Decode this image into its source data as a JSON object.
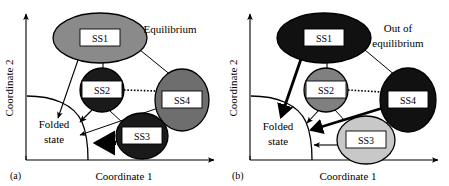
{
  "figure": {
    "panels": [
      {
        "id": "a",
        "panel_label": "(a)",
        "annotation": "Equilibrium",
        "annotation_lines": [
          "Equilibrium"
        ],
        "axes": {
          "xlabel": "Coordinate 1",
          "ylabel": "Coordinate 2"
        },
        "basin_label_lines": [
          "Folded",
          "state"
        ],
        "nodes": [
          {
            "id": "SS1",
            "label": "SS1",
            "cx": 100,
            "cy": 38,
            "rx": 47,
            "ry": 25,
            "fill": "#8a8a8a",
            "shade": "medium-gray"
          },
          {
            "id": "SS2",
            "label": "SS2",
            "cx": 102,
            "cy": 90,
            "rx": 22,
            "ry": 22,
            "fill": "#1a1a1a",
            "shade": "black"
          },
          {
            "id": "SS3",
            "label": "SS3",
            "cx": 142,
            "cy": 136,
            "rx": 26,
            "ry": 23,
            "fill": "#1a1a1a",
            "shade": "black"
          },
          {
            "id": "SS4",
            "label": "SS4",
            "cx": 182,
            "cy": 100,
            "rx": 27,
            "ry": 31,
            "fill": "#6e6e6e",
            "shade": "dark-gray"
          }
        ],
        "edges": [
          {
            "from": "SS1",
            "to": "folded-state",
            "style": "thin-arrow"
          },
          {
            "from": "SS1",
            "to": "SS2",
            "style": "plain-line"
          },
          {
            "from": "SS1",
            "to": "SS4",
            "style": "plain-line"
          },
          {
            "from": "SS2",
            "to": "folded-state",
            "style": "thin-arrow"
          },
          {
            "from": "SS2",
            "to": "SS4",
            "style": "dotted-line"
          },
          {
            "from": "SS2",
            "to": "SS3",
            "style": "plain-line"
          },
          {
            "from": "SS3",
            "to": "folded-state",
            "style": "thick-arrow"
          },
          {
            "from": "SS4",
            "to": "folded-state",
            "style": "thin-arrow"
          },
          {
            "from": "SS4",
            "to": "SS3",
            "style": "plain-line"
          }
        ]
      },
      {
        "id": "b",
        "panel_label": "(b)",
        "annotation": "Out of equilibrium",
        "annotation_lines": [
          "Out of",
          "equilibrium"
        ],
        "axes": {
          "xlabel": "Coordinate 1",
          "ylabel": "Coordinate 2"
        },
        "basin_label_lines": [
          "Folded",
          "state"
        ],
        "nodes": [
          {
            "id": "SS1",
            "label": "SS1",
            "cx": 100,
            "cy": 38,
            "rx": 47,
            "ry": 25,
            "fill": "#111111",
            "shade": "black"
          },
          {
            "id": "SS2",
            "label": "SS2",
            "cx": 102,
            "cy": 90,
            "rx": 22,
            "ry": 22,
            "fill": "#808080",
            "shade": "medium-gray"
          },
          {
            "id": "SS3",
            "label": "SS3",
            "cx": 142,
            "cy": 140,
            "rx": 29,
            "ry": 24,
            "fill": "#c8c8c8",
            "shade": "light-gray"
          },
          {
            "id": "SS4",
            "label": "SS4",
            "cx": 184,
            "cy": 100,
            "rx": 28,
            "ry": 32,
            "fill": "#111111",
            "shade": "black"
          }
        ],
        "edges": [
          {
            "from": "SS1",
            "to": "folded-state",
            "style": "thick-arrow"
          },
          {
            "from": "SS1",
            "to": "SS2",
            "style": "plain-line"
          },
          {
            "from": "SS1",
            "to": "SS4",
            "style": "plain-line"
          },
          {
            "from": "SS2",
            "to": "folded-state",
            "style": "thin-arrow"
          },
          {
            "from": "SS2",
            "to": "SS4",
            "style": "dotted-line"
          },
          {
            "from": "SS2",
            "to": "SS3",
            "style": "plain-line"
          },
          {
            "from": "SS3",
            "to": "folded-state",
            "style": "thin-arrow"
          },
          {
            "from": "SS4",
            "to": "folded-state",
            "style": "thick-arrow"
          },
          {
            "from": "SS4",
            "to": "SS3",
            "style": "plain-line"
          }
        ]
      }
    ],
    "colors": {
      "background": "#ffffff",
      "stroke": "#000000",
      "node_label_box": "#ffffff",
      "black": "#111111",
      "dark_gray": "#6e6e6e",
      "medium_gray": "#8a8a8a",
      "light_gray": "#c8c8c8"
    }
  }
}
